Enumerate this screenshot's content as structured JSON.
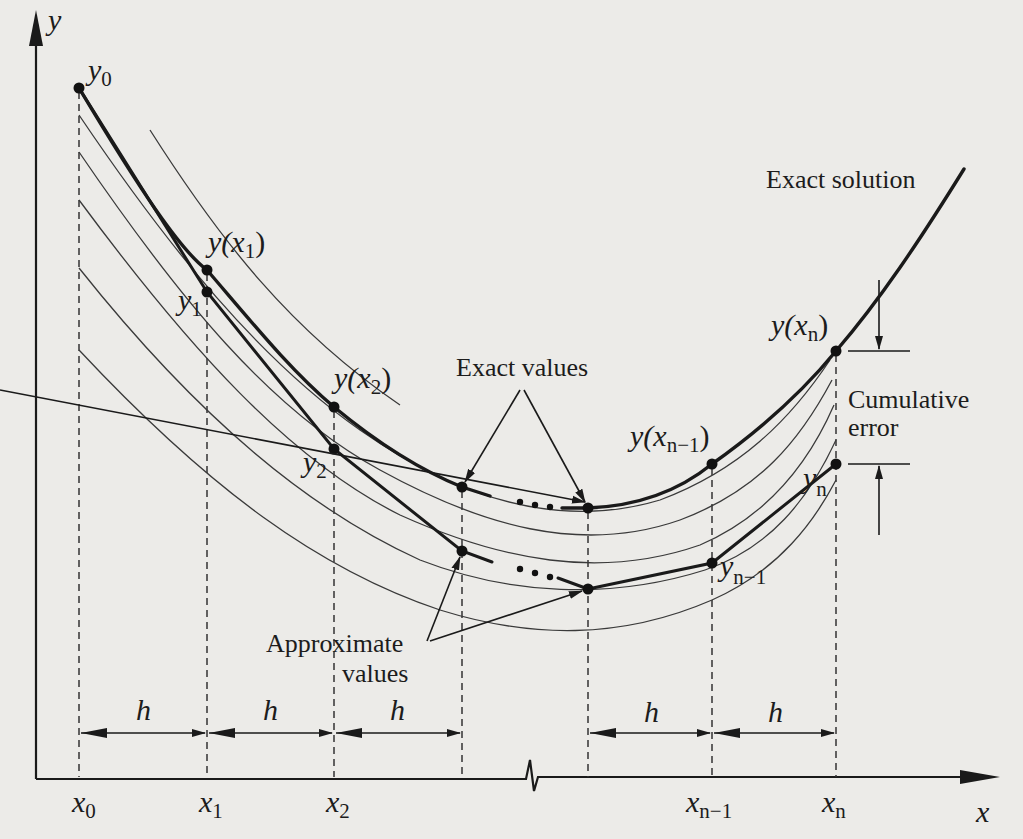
{
  "figure": {
    "background_color": "#ecebe8",
    "ink_color": "#1a1a1a"
  },
  "axes": {
    "x_label": "x",
    "y_label": "y",
    "origin": [
      36,
      779
    ],
    "x_end": 1000,
    "y_top": 12,
    "axis_break_x": 531
  },
  "grid_points": [
    {
      "name": "x0",
      "base": "x",
      "sub": "0",
      "px": 79
    },
    {
      "name": "x1",
      "base": "x",
      "sub": "1",
      "px": 207
    },
    {
      "name": "x2",
      "base": "x",
      "sub": "2",
      "px": 334
    },
    {
      "name": "x3",
      "base": "",
      "sub": "",
      "px": 462
    },
    {
      "name": "xn-2",
      "base": "",
      "sub": "",
      "px": 588
    },
    {
      "name": "xn-1",
      "base": "x",
      "sub": "n−1",
      "px": 712
    },
    {
      "name": "xn",
      "base": "x",
      "sub": "n",
      "px": 836
    }
  ],
  "step_label": "h",
  "step_arrows": [
    {
      "from": 79,
      "to": 207
    },
    {
      "from": 207,
      "to": 334
    },
    {
      "from": 334,
      "to": 462
    },
    {
      "from": 588,
      "to": 712
    },
    {
      "from": 712,
      "to": 836
    }
  ],
  "exact_points": [
    {
      "label_base": "y",
      "label_sub": "0",
      "label_paren": false,
      "x": 79,
      "y": 88
    },
    {
      "label_base": "y(x",
      "label_sub": "1",
      "label_paren": true,
      "x": 207,
      "y": 270
    },
    {
      "label_base": "y(x",
      "label_sub": "2",
      "label_paren": true,
      "x": 334,
      "y": 407
    },
    {
      "label_base": "",
      "label_sub": "",
      "label_paren": false,
      "x": 462,
      "y": 487
    },
    {
      "label_base": "",
      "label_sub": "",
      "label_paren": false,
      "x": 588,
      "y": 508
    },
    {
      "label_base": "y(x",
      "label_sub": "n−1",
      "label_paren": true,
      "x": 712,
      "y": 464
    },
    {
      "label_base": "y(x",
      "label_sub": "n",
      "label_paren": true,
      "x": 836,
      "y": 351
    }
  ],
  "approx_points": [
    {
      "label_base": "y",
      "label_sub": "1",
      "x": 207,
      "y": 292
    },
    {
      "label_base": "y",
      "label_sub": "2",
      "x": 334,
      "y": 449
    },
    {
      "label_base": "",
      "label_sub": "",
      "x": 462,
      "y": 551
    },
    {
      "label_base": "",
      "label_sub": "",
      "x": 588,
      "y": 589
    },
    {
      "label_base": "y",
      "label_sub": "n−1",
      "x": 712,
      "y": 563
    },
    {
      "label_base": "y",
      "label_sub": "n",
      "x": 836,
      "y": 464
    }
  ],
  "annotations": {
    "exact_solution": "Exact solution",
    "exact_values": "Exact values",
    "approximate_values_line1": "Approximate",
    "approximate_values_line2": "values",
    "cumulative_error_line1": "Cumulative",
    "cumulative_error_line2": "error",
    "ellipsis": "…"
  },
  "labels": {
    "y0_base": "y",
    "y0_sub": "0",
    "yx1_base": "y(x",
    "yx1_sub": "1",
    "close": ")",
    "y1_base": "y",
    "y1_sub": "1",
    "yx2_base": "y(x",
    "yx2_sub": "2",
    "y2_base": "y",
    "y2_sub": "2",
    "yxn1_base": "y(x",
    "yxn1_sub": "n−1",
    "yn1_base": "y",
    "yn1_sub": "n−1",
    "yxn_base": "y(x",
    "yxn_sub": "n",
    "yn_base": "y",
    "yn_sub": "n",
    "x0_base": "x",
    "x0_sub": "0",
    "x1_base": "x",
    "x1_sub": "1",
    "x2_base": "x",
    "x2_sub": "2",
    "xn1_base": "x",
    "xn1_sub": "n−1",
    "xn_base": "x",
    "xn_sub": "n",
    "x_axis": "x",
    "y_axis": "y",
    "h": "h"
  }
}
